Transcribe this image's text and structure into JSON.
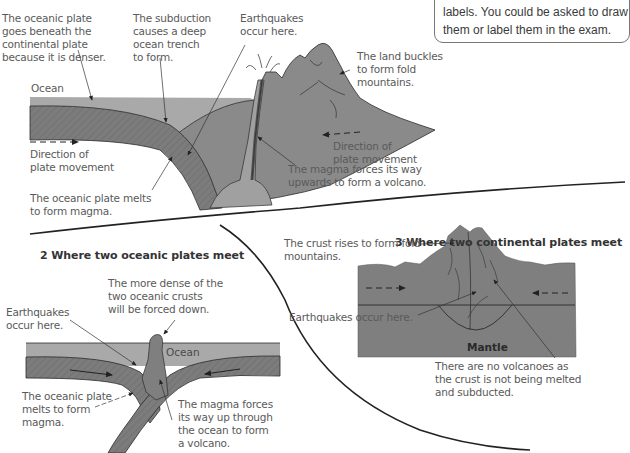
{
  "note": {
    "text": "labels. You could be asked to draw\nthem or label them in the exam."
  },
  "colors": {
    "ocean": "#a9a9a9",
    "oceanic_plate": "#7c7c7c",
    "continental_crust": "#8a8a8a",
    "magma_chamber": "#a0a0a0",
    "outline": "#2b2b2b"
  },
  "section1": {
    "labels": {
      "oceanic_plate_denser": "The oceanic plate\ngoes beneath the\ncontinental plate\nbecause it is denser.",
      "subduction_trench": "The subduction\ncauses a deep\nocean trench\nto form.",
      "earthquakes": "Earthquakes\noccur here.",
      "land_buckles": "The land buckles\nto form fold\nmountains.",
      "ocean": "Ocean",
      "direction_left": "Direction of\nplate movement",
      "direction_right": "Direction of\nplate movement",
      "magma_volcano": "The magma forces its way\nupwards to form a volcano.",
      "plate_melts": "The oceanic plate melts\nto form magma."
    }
  },
  "section2": {
    "heading": "2  Where two oceanic plates meet",
    "labels": {
      "more_dense": "The more dense of the\ntwo oceanic crusts\nwill be forced down.",
      "earthquakes": "Earthquakes\noccur here.",
      "ocean": "Ocean",
      "plate_melts": "The oceanic plate\nmelts to form\nmagma.",
      "magma_up": "The magma forces\nits way up through\nthe ocean to form\na volcano."
    }
  },
  "section3": {
    "heading": "3  Where two continental plates meet",
    "labels": {
      "crust_rises": "The crust rises to form fold\nmountains.",
      "earthquakes": "Earthquakes occur here.",
      "mantle": "Mantle",
      "no_volcanoes": "There are no volcanoes as\nthe crust is not being melted\nand subducted."
    }
  }
}
